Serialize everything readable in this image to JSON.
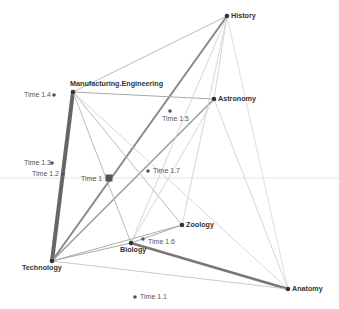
{
  "diagram": {
    "type": "network-biplot",
    "reference_line_y": 178,
    "nodes": [
      {
        "id": "history",
        "label": "History",
        "kind": "discipline",
        "x": 227,
        "y": 16,
        "lx": 231,
        "ly": 12
      },
      {
        "id": "manufacturing",
        "label": "Manufacturing.Engineering",
        "kind": "discipline",
        "x": 73,
        "y": 92,
        "lx": 70,
        "ly": 80
      },
      {
        "id": "astronomy",
        "label": "Astronomy",
        "kind": "discipline",
        "x": 214,
        "y": 99,
        "lx": 218,
        "ly": 95
      },
      {
        "id": "zoology",
        "label": "Zoology",
        "kind": "discipline",
        "x": 182,
        "y": 225,
        "lx": 186,
        "ly": 221
      },
      {
        "id": "biology",
        "label": "Biology",
        "kind": "discipline",
        "x": 131,
        "y": 243,
        "lx": 120,
        "ly": 246
      },
      {
        "id": "technology",
        "label": "Technology",
        "kind": "discipline",
        "x": 52,
        "y": 261,
        "lx": 22,
        "ly": 264
      },
      {
        "id": "anatomy",
        "label": "Anatomy",
        "kind": "discipline",
        "x": 288,
        "y": 289,
        "lx": 292,
        "ly": 285
      },
      {
        "id": "t1",
        "label": "Time 1",
        "kind": "time-main",
        "x": 109,
        "y": 178,
        "lx": 81,
        "ly": 175
      },
      {
        "id": "t11",
        "label": "Time 1.1",
        "kind": "time",
        "x": 135,
        "y": 297,
        "lx": 140,
        "ly": 293
      },
      {
        "id": "t12",
        "label": "Time 1.2",
        "kind": "time",
        "x": 63,
        "y": 174,
        "lx": 32,
        "ly": 170
      },
      {
        "id": "t13",
        "label": "Time 1.3",
        "kind": "time",
        "x": 52,
        "y": 163,
        "lx": 24,
        "ly": 159
      },
      {
        "id": "t14",
        "label": "Time 1.4",
        "kind": "time",
        "x": 54,
        "y": 95,
        "lx": 24,
        "ly": 91
      },
      {
        "id": "t15",
        "label": "Time 1.5",
        "kind": "time",
        "x": 170,
        "y": 111,
        "lx": 162,
        "ly": 115
      },
      {
        "id": "t16",
        "label": "Time 1.6",
        "kind": "time",
        "x": 143,
        "y": 239,
        "lx": 148,
        "ly": 238
      },
      {
        "id": "t17",
        "label": "Time 1.7",
        "kind": "time",
        "x": 148,
        "y": 171,
        "lx": 153,
        "ly": 167
      }
    ],
    "edges": [
      {
        "from": "manufacturing",
        "to": "technology",
        "weight": 4,
        "color": "#666666"
      },
      {
        "from": "technology",
        "to": "history",
        "weight": 2,
        "color": "#888888"
      },
      {
        "from": "biology",
        "to": "anatomy",
        "weight": 2.5,
        "color": "#777777"
      },
      {
        "from": "technology",
        "to": "astronomy",
        "weight": 1.5,
        "color": "#999999"
      },
      {
        "from": "manufacturing",
        "to": "history",
        "weight": 1,
        "color": "#bbbbbb"
      },
      {
        "from": "manufacturing",
        "to": "astronomy",
        "weight": 1,
        "color": "#aaaaaa"
      },
      {
        "from": "manufacturing",
        "to": "biology",
        "weight": 1,
        "color": "#bbbbbb"
      },
      {
        "from": "manufacturing",
        "to": "zoology",
        "weight": 1,
        "color": "#bbbbbb"
      },
      {
        "from": "manufacturing",
        "to": "anatomy",
        "weight": 0.8,
        "color": "#cccccc"
      },
      {
        "from": "technology",
        "to": "zoology",
        "weight": 1,
        "color": "#aaaaaa"
      },
      {
        "from": "technology",
        "to": "biology",
        "weight": 1,
        "color": "#aaaaaa"
      },
      {
        "from": "technology",
        "to": "anatomy",
        "weight": 0.8,
        "color": "#bbbbbb"
      },
      {
        "from": "biology",
        "to": "zoology",
        "weight": 1,
        "color": "#aaaaaa"
      },
      {
        "from": "biology",
        "to": "history",
        "weight": 0.8,
        "color": "#cccccc"
      },
      {
        "from": "zoology",
        "to": "history",
        "weight": 0.8,
        "color": "#cccccc"
      },
      {
        "from": "biology",
        "to": "astronomy",
        "weight": 0.8,
        "color": "#cccccc"
      },
      {
        "from": "history",
        "to": "anatomy",
        "weight": 0.8,
        "color": "#d5d5d5"
      },
      {
        "from": "astronomy",
        "to": "anatomy",
        "weight": 0.8,
        "color": "#cccccc"
      },
      {
        "from": "history",
        "to": "astronomy",
        "weight": 0.8,
        "color": "#cccccc"
      }
    ]
  }
}
